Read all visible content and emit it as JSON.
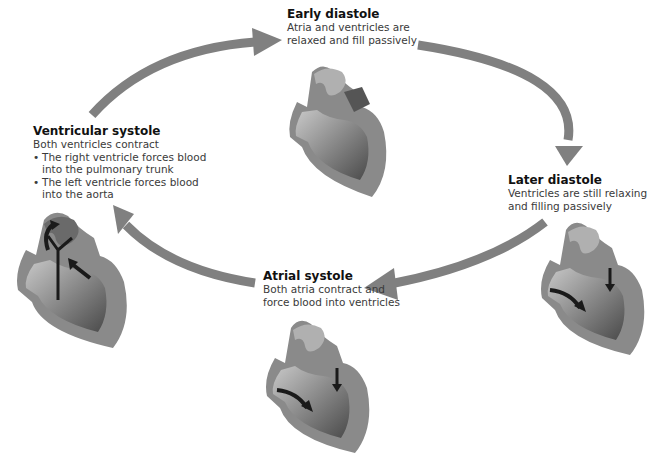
{
  "colors": {
    "arrow": "#808080",
    "heart_wall": "#8a8a8a",
    "heart_dark": "#4a4a4a",
    "heart_light": "#c8c8c8",
    "flow_arrow": "#1a1a1a",
    "text": "#3a3a3a",
    "title": "#111111"
  },
  "stages": {
    "early_diastole": {
      "title": "Early diastole",
      "desc_line1": "Atria and ventricles are",
      "desc_line2": "relaxed and fill passively"
    },
    "later_diastole": {
      "title": "Later diastole",
      "desc_line1": "Ventricles are still relaxing",
      "desc_line2": "and filling passively"
    },
    "atrial_systole": {
      "title": "Atrial systole",
      "desc_line1": "Both atria contract and",
      "desc_line2": "force blood into ventricles"
    },
    "ventricular_systole": {
      "title": "Ventricular systole",
      "desc": "Both ventricles contract",
      "bullets": [
        "The right ventricle forces blood into the pulmonary trunk",
        "The left ventricle forces blood into the aorta"
      ],
      "bullet1_line1": "The right ventricle forces blood",
      "bullet1_line2": "into the pulmonary trunk",
      "bullet2_line1": "The left ventricle forces blood",
      "bullet2_line2": "into the aorta"
    }
  },
  "cycle_arrows": [
    {
      "from": "ventricular_systole",
      "to": "early_diastole"
    },
    {
      "from": "early_diastole",
      "to": "later_diastole"
    },
    {
      "from": "later_diastole",
      "to": "atrial_systole"
    },
    {
      "from": "atrial_systole",
      "to": "ventricular_systole"
    }
  ]
}
